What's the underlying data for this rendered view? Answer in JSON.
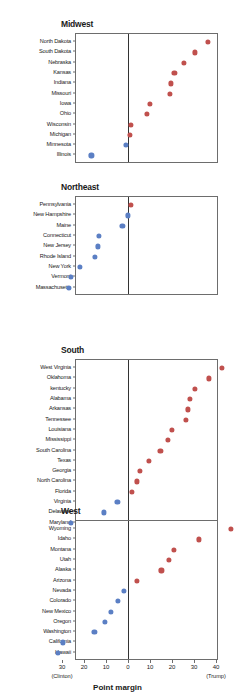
{
  "chart_data": {
    "type": "scatter",
    "xlabel": "Point margin",
    "ylabel": "",
    "xlim": [
      -36,
      46
    ],
    "grid": false,
    "legend": null,
    "axis": {
      "tick_values": [
        -30,
        -20,
        -10,
        0,
        10,
        20,
        30,
        40
      ],
      "tick_labels": [
        "30",
        "20",
        "10",
        "0",
        "10",
        "20",
        "30",
        "40"
      ],
      "left_end_label": "(Clinton)",
      "right_end_label": "(Trump)",
      "zero_line": 0
    },
    "colors": {
      "trump": "#c0504d",
      "clinton": "#5b7fc4"
    },
    "panels": [
      {
        "name": "Midwest",
        "categories": [
          "North Dakota",
          "South Dakota",
          "Nebraska",
          "Kansas",
          "Indiana",
          "Missouri",
          "Iowa",
          "Ohio",
          "Wisconsin",
          "Michigan",
          "Minnesota",
          "Illinois"
        ],
        "values": [
          35.7,
          29.8,
          25.1,
          20.6,
          19.0,
          18.6,
          9.4,
          8.1,
          0.8,
          0.3,
          -1.5,
          -17.1
        ],
        "winner": [
          "Trump",
          "Trump",
          "Trump",
          "Trump",
          "Trump",
          "Trump",
          "Trump",
          "Trump",
          "Trump",
          "Trump",
          "Clinton",
          "Clinton"
        ]
      },
      {
        "name": "Northeast",
        "categories": [
          "Pennsylvania",
          "New Hampshire",
          "Maine",
          "Connecticut",
          "New Jersey",
          "Rhode Island",
          "New York",
          "Vermont",
          "Massachusetts"
        ],
        "values": [
          0.7,
          -0.4,
          -3.0,
          -13.6,
          -14.1,
          -15.5,
          -22.5,
          -26.4,
          -27.2
        ],
        "winner": [
          "Trump",
          "Clinton",
          "Clinton",
          "Clinton",
          "Clinton",
          "Clinton",
          "Clinton",
          "Clinton",
          "Clinton"
        ]
      },
      {
        "name": "South",
        "categories": [
          "West Virginia",
          "Oklahoma",
          "kentucky",
          "Alabama",
          "Arkansas",
          "Tennessee",
          "Louisiana",
          "Mississippi",
          "South Carolina",
          "Texas",
          "Georgia",
          "North Carolina",
          "Florida",
          "Virginia",
          "Delaware",
          "Maryland"
        ],
        "values": [
          42.1,
          36.4,
          29.8,
          27.7,
          26.9,
          26.0,
          19.6,
          17.8,
          14.3,
          9.0,
          5.1,
          3.7,
          1.2,
          -5.3,
          -11.4,
          -26.4
        ],
        "winner": [
          "Trump",
          "Trump",
          "Trump",
          "Trump",
          "Trump",
          "Trump",
          "Trump",
          "Trump",
          "Trump",
          "Trump",
          "Trump",
          "Trump",
          "Trump",
          "Clinton",
          "Clinton",
          "Clinton"
        ]
      },
      {
        "name": "West",
        "categories": [
          "Wyoming",
          "Idaho",
          "Montana",
          "Utah",
          "Alaska",
          "Arizona",
          "Nevada",
          "Colorado",
          "New Mexico",
          "Oregon",
          "Washington",
          "California",
          "Hawaii"
        ],
        "values": [
          46.3,
          31.8,
          20.4,
          18.1,
          14.7,
          3.5,
          -2.4,
          -4.9,
          -8.2,
          -11.0,
          -15.7,
          -30.1,
          -32.2
        ],
        "winner": [
          "Trump",
          "Trump",
          "Trump",
          "Trump",
          "Trump",
          "Trump",
          "Clinton",
          "Clinton",
          "Clinton",
          "Clinton",
          "Clinton",
          "Clinton",
          "Clinton"
        ]
      }
    ]
  }
}
